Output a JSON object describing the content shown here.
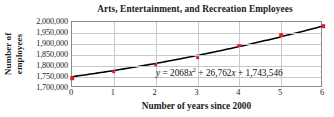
{
  "chart_data": {
    "type": "scatter",
    "title": "Arts, Entertainment, and Recreation Employees",
    "xlabel": "Number of years since 2000",
    "ylabel_line1": "Number of",
    "ylabel_line2": "employees",
    "x": [
      0,
      1,
      2,
      3,
      4,
      5,
      6
    ],
    "values": [
      1745000,
      1774000,
      1805000,
      1838000,
      1892000,
      1940000,
      1980000
    ],
    "xlim": [
      0,
      6
    ],
    "ylim": [
      1700000,
      2000000
    ],
    "xticks": [
      "0",
      "1",
      "2",
      "3",
      "4",
      "5",
      "6"
    ],
    "xtick_values": [
      0,
      1,
      2,
      3,
      4,
      5,
      6
    ],
    "yticks": [
      "2,000,000",
      "1,950,000",
      "1,900,000",
      "1,850,000",
      "1,800,000",
      "1,750,000",
      "1,700,000"
    ],
    "ytick_values": [
      2000000,
      1950000,
      1900000,
      1850000,
      1800000,
      1750000,
      1700000
    ],
    "grid": true,
    "legend": false,
    "annotation": {
      "y_symbol": "y",
      "equals": "=",
      "a_coefficient": "2068",
      "x_symbol": "x",
      "exponent": "2",
      "plus_1": "+",
      "b_coefficient": "26,762",
      "x_symbol_2": "x",
      "plus_2": "+",
      "c_constant": "1,743,546",
      "full_text": "y = 2068x² + 26,762x + 1,743,546"
    },
    "trendline": {
      "kind": "quadratic",
      "a": 2068,
      "b": 26762,
      "c": 1743546
    },
    "colors": {
      "marker": "#d6202a",
      "curve": "#000000",
      "grid": "#c9c9c9",
      "frame": "#8a8a8a",
      "text": "#1b1b1b",
      "background": "#ffffff"
    }
  }
}
